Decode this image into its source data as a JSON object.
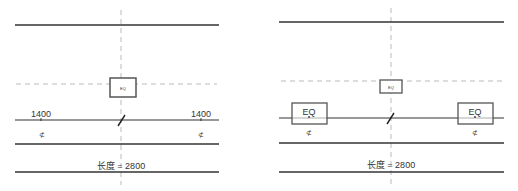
{
  "colors": {
    "line": "#333333",
    "dash": "#9a9a9a",
    "box": "#555555",
    "text": "#333333"
  },
  "left": {
    "dim_left": "1400",
    "dim_right": "1400",
    "center_box_label": "EQ",
    "lock_icon_left": "⊄",
    "lock_icon_right": "⊄",
    "length_label": "长度 = 2800"
  },
  "right": {
    "center_box_label": "EQ",
    "eq_left": "EQ",
    "eq_right": "EQ",
    "lock_icon_left": "⊄",
    "lock_icon_right": "⊄",
    "length_label": "长度 = 2800"
  }
}
